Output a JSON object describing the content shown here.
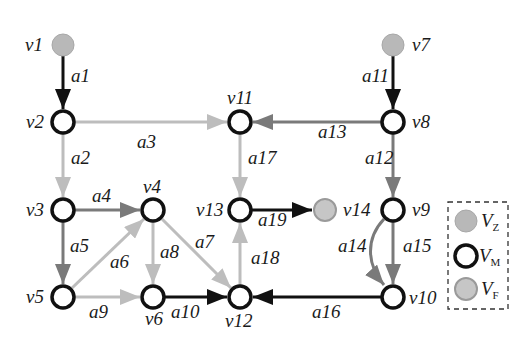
{
  "colors": {
    "black": "#111111",
    "dark_gray": "#7a7a7a",
    "light_gray": "#bdbdbd",
    "fill_gray": "#b8b8b8",
    "fill_gray_light": "#c6c6c6",
    "background": "#ffffff"
  },
  "nodes": [
    {
      "id": "v1",
      "label": "v1",
      "type": "VZ",
      "x": 63,
      "y": 45
    },
    {
      "id": "v2",
      "label": "v2",
      "type": "VM",
      "x": 63,
      "y": 122
    },
    {
      "id": "v3",
      "label": "v3",
      "type": "VM",
      "x": 63,
      "y": 210
    },
    {
      "id": "v4",
      "label": "v4",
      "type": "VM",
      "x": 153,
      "y": 210
    },
    {
      "id": "v5",
      "label": "v5",
      "type": "VM",
      "x": 63,
      "y": 297
    },
    {
      "id": "v6",
      "label": "v6",
      "type": "VM",
      "x": 153,
      "y": 297
    },
    {
      "id": "v7",
      "label": "v7",
      "type": "VZ",
      "x": 393,
      "y": 45
    },
    {
      "id": "v8",
      "label": "v8",
      "type": "VM",
      "x": 393,
      "y": 122
    },
    {
      "id": "v9",
      "label": "v9",
      "type": "VM",
      "x": 393,
      "y": 210
    },
    {
      "id": "v10",
      "label": "v10",
      "type": "VM",
      "x": 393,
      "y": 297
    },
    {
      "id": "v11",
      "label": "v11",
      "type": "VM",
      "x": 240,
      "y": 122
    },
    {
      "id": "v12",
      "label": "v12",
      "type": "VM",
      "x": 240,
      "y": 297
    },
    {
      "id": "v13",
      "label": "v13",
      "type": "VM",
      "x": 240,
      "y": 210
    },
    {
      "id": "v14",
      "label": "v14",
      "type": "VF",
      "x": 325,
      "y": 210
    }
  ],
  "arcs": [
    {
      "id": "a1",
      "from": "v1",
      "to": "v2",
      "shade": "black"
    },
    {
      "id": "a2",
      "from": "v2",
      "to": "v3",
      "shade": "light"
    },
    {
      "id": "a3",
      "from": "v2",
      "to": "v11",
      "shade": "light"
    },
    {
      "id": "a4",
      "from": "v3",
      "to": "v4",
      "shade": "dark"
    },
    {
      "id": "a5",
      "from": "v3",
      "to": "v5",
      "shade": "dark"
    },
    {
      "id": "a6",
      "from": "v5",
      "to": "v4",
      "shade": "light"
    },
    {
      "id": "a7",
      "from": "v4",
      "to": "v12",
      "shade": "light"
    },
    {
      "id": "a8",
      "from": "v4",
      "to": "v6",
      "shade": "light"
    },
    {
      "id": "a9",
      "from": "v5",
      "to": "v6",
      "shade": "light"
    },
    {
      "id": "a10",
      "from": "v6",
      "to": "v12",
      "shade": "black"
    },
    {
      "id": "a11",
      "from": "v7",
      "to": "v8",
      "shade": "black"
    },
    {
      "id": "a12",
      "from": "v8",
      "to": "v9",
      "shade": "dark"
    },
    {
      "id": "a13",
      "from": "v8",
      "to": "v11",
      "shade": "dark"
    },
    {
      "id": "a14",
      "from": "v9",
      "to": "v10",
      "shade": "dark",
      "curved": true
    },
    {
      "id": "a15",
      "from": "v9",
      "to": "v10",
      "shade": "dark"
    },
    {
      "id": "a16",
      "from": "v10",
      "to": "v12",
      "shade": "black"
    },
    {
      "id": "a17",
      "from": "v11",
      "to": "v13",
      "shade": "light"
    },
    {
      "id": "a18",
      "from": "v12",
      "to": "v13",
      "shade": "light"
    },
    {
      "id": "a19",
      "from": "v13",
      "to": "v14",
      "shade": "black"
    }
  ],
  "node_labels": {
    "v1": "v1",
    "v2": "v2",
    "v3": "v3",
    "v4": "v4",
    "v5": "v5",
    "v6": "v6",
    "v7": "v7",
    "v8": "v8",
    "v9": "v9",
    "v10": "v10",
    "v11": "v11",
    "v12": "v12",
    "v13": "v13",
    "v14": "v14"
  },
  "arc_labels": {
    "a1": "a1",
    "a2": "a2",
    "a3": "a3",
    "a4": "a4",
    "a5": "a5",
    "a6": "a6",
    "a7": "a7",
    "a8": "a8",
    "a9": "a9",
    "a10": "a10",
    "a11": "a11",
    "a12": "a12",
    "a13": "a13",
    "a14": "a14",
    "a15": "a15",
    "a16": "a16",
    "a17": "a17",
    "a18": "a18",
    "a19": "a19"
  },
  "legend": {
    "items": [
      {
        "symbol": "filled-gray-circle",
        "main": "V",
        "sub": "Z"
      },
      {
        "symbol": "hollow-black-circle",
        "main": "V",
        "sub": "M"
      },
      {
        "symbol": "filled-light-gray-circle",
        "main": "V",
        "sub": "F"
      }
    ]
  }
}
